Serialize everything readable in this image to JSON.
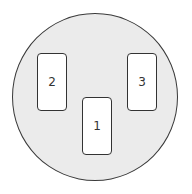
{
  "diagram": {
    "type": "circular plate with three rectangular slots",
    "colors": {
      "disc_fill": "#ebebeb",
      "outline": "#333333",
      "slot_fill": "#ffffff"
    },
    "slots": [
      {
        "id": "1",
        "label": "1",
        "position": "bottom-center"
      },
      {
        "id": "2",
        "label": "2",
        "position": "upper-left"
      },
      {
        "id": "3",
        "label": "3",
        "position": "upper-right"
      }
    ]
  }
}
